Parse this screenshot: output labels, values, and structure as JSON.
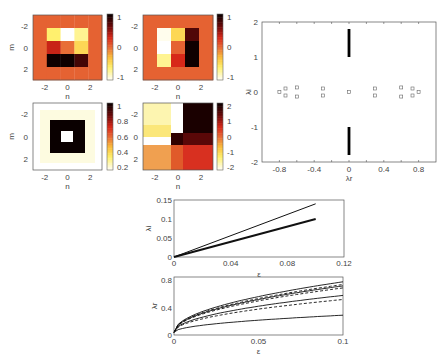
{
  "chart_data": [
    {
      "id": "heatmap-a",
      "type": "heatmap",
      "xlabel": "n",
      "ylabel": "m",
      "xticks": [
        "-2",
        "0",
        "2"
      ],
      "yticks": [
        "-2",
        "0",
        "2"
      ],
      "grid": [
        [
          0.05,
          0.05,
          0.05,
          0.05,
          0.05
        ],
        [
          0.05,
          -0.6,
          -1.0,
          -0.7,
          0.05
        ],
        [
          0.05,
          0.35,
          0.0,
          -0.45,
          0.05
        ],
        [
          0.05,
          1.0,
          1.0,
          0.8,
          0.05
        ],
        [
          0.05,
          0.05,
          0.05,
          0.05,
          0.05
        ]
      ],
      "colorbar": {
        "ticks": [
          "1",
          "0",
          "-1"
        ],
        "range": [
          -1,
          1
        ]
      }
    },
    {
      "id": "heatmap-b",
      "type": "heatmap",
      "xlabel": "n",
      "ylabel": "",
      "xticks": [
        "-2",
        "0",
        "2"
      ],
      "yticks": [
        "-2",
        "0",
        "2"
      ],
      "grid": [
        [
          0.05,
          0.05,
          0.05,
          0.05,
          0.05
        ],
        [
          0.05,
          -0.95,
          -0.45,
          0.75,
          0.05
        ],
        [
          0.05,
          -1.0,
          0.05,
          1.0,
          0.05
        ],
        [
          0.05,
          -0.7,
          0.3,
          1.0,
          0.05
        ],
        [
          0.05,
          0.05,
          0.05,
          0.05,
          0.05
        ]
      ],
      "colorbar": {
        "ticks": [
          "1",
          "0",
          "-1"
        ],
        "range": [
          -1,
          1
        ]
      }
    },
    {
      "id": "heatmap-c",
      "type": "heatmap",
      "xlabel": "n",
      "ylabel": "m",
      "xticks": [
        "-2",
        "0",
        "2"
      ],
      "yticks": [
        "-2",
        "0",
        "2"
      ],
      "description": "black square ring with white center on pale background",
      "colorbar": {
        "ticks": [
          "1",
          "0.8",
          "0.6",
          "0.4",
          "0.2"
        ],
        "range": [
          0,
          1.1
        ]
      }
    },
    {
      "id": "heatmap-d",
      "type": "heatmap",
      "xlabel": "n",
      "ylabel": "",
      "xticks": [
        "-2",
        "0",
        "2"
      ],
      "yticks": [
        "-2",
        "0",
        "2"
      ],
      "description": "quadrant pattern: pale yellow top-left, white column, black top-right, orange/red bottom",
      "colorbar": {
        "ticks": [
          "2",
          "1",
          "0",
          "-1",
          "-2"
        ],
        "range": [
          -2.8,
          2.8
        ]
      }
    },
    {
      "id": "spectrum",
      "type": "scatter",
      "xlabel": "λr",
      "ylabel": "λi",
      "xlim": [
        -1,
        1
      ],
      "ylim": [
        -2,
        2
      ],
      "xticks": [
        "-0.8",
        "-0.4",
        "0",
        "0.4",
        "0.8"
      ],
      "yticks": [
        "2",
        "1",
        "0",
        "-1",
        "-2"
      ],
      "points": [
        [
          -0.8,
          0
        ],
        [
          -0.73,
          0.1
        ],
        [
          -0.73,
          -0.1
        ],
        [
          -0.6,
          0.13
        ],
        [
          -0.6,
          -0.13
        ],
        [
          -0.3,
          0.1
        ],
        [
          -0.3,
          -0.1
        ],
        [
          0,
          0
        ],
        [
          0.3,
          0.1
        ],
        [
          0.3,
          -0.1
        ],
        [
          0.6,
          0.13
        ],
        [
          0.6,
          -0.13
        ],
        [
          0.73,
          0.1
        ],
        [
          0.73,
          -0.1
        ],
        [
          0.8,
          0
        ]
      ],
      "continuous_bands": [
        {
          "x": 0,
          "y_from": 1.0,
          "y_to": 1.8
        },
        {
          "x": 0,
          "y_from": -1.8,
          "y_to": -1.0
        }
      ]
    },
    {
      "id": "imag-growth",
      "type": "line",
      "xlabel": "ε",
      "ylabel": "λi",
      "xlim": [
        0,
        0.12
      ],
      "ylim": [
        0,
        0.15
      ],
      "xticks": [
        "0",
        "0.04",
        "0.08",
        "0.12"
      ],
      "yticks": [
        "0.15",
        "0.1",
        "0.05",
        "0"
      ],
      "series": [
        {
          "name": "upper",
          "x": [
            0,
            0.1
          ],
          "y": [
            0,
            0.14
          ],
          "width": 1
        },
        {
          "name": "lower",
          "x": [
            0,
            0.1
          ],
          "y": [
            0,
            0.1
          ],
          "width": 2
        }
      ]
    },
    {
      "id": "real-growth",
      "type": "line",
      "xlabel": "ε",
      "ylabel": "λr",
      "xlim": [
        0,
        0.1
      ],
      "ylim": [
        0,
        0.85
      ],
      "xticks": [
        "0",
        "0.05",
        "0.1"
      ],
      "yticks": [
        "0.8",
        "0.4",
        "0"
      ],
      "series": [
        {
          "name": "s1",
          "style": "solid",
          "y_at_end": 0.78
        },
        {
          "name": "s2",
          "style": "dashed",
          "y_at_end": 0.74
        },
        {
          "name": "s3",
          "style": "solid",
          "y_at_end": 0.72
        },
        {
          "name": "s4",
          "style": "dashed",
          "y_at_end": 0.69
        },
        {
          "name": "s5",
          "style": "solid",
          "y_at_end": 0.58
        },
        {
          "name": "s6",
          "style": "dashed",
          "y_at_end": 0.52
        },
        {
          "name": "s7",
          "style": "solid",
          "y_at_end": 0.29
        }
      ]
    }
  ]
}
